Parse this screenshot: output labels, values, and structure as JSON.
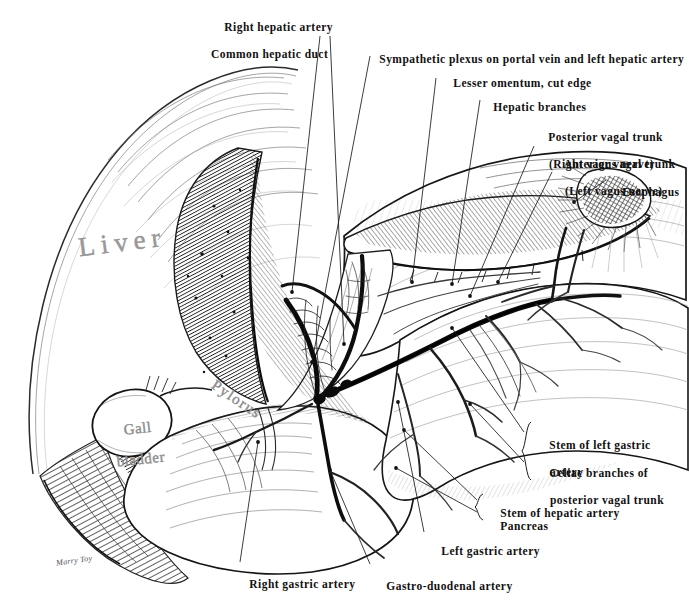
{
  "plate": {
    "title": "Stomach, liver and celiac vagal branches — pen and ink anatomical plate",
    "width": 689,
    "height": 604,
    "background": "#ffffff",
    "ink_color": "#1a1a1a",
    "label_color": "#111111",
    "organ_label_color": "#8d8d8d",
    "signature": "Marry Toy"
  },
  "callouts": [
    {
      "name": "right-hepatic-artery",
      "lines": [
        "Right hepatic artery",
        "Common hepatic duct"
      ],
      "align": "left",
      "x": 211,
      "y": 7
    },
    {
      "name": "sympathetic-plexus",
      "lines": [
        "Sympathetic plexus on portal vein and left hepatic artery"
      ],
      "align": "left",
      "x": 366,
      "y": 39
    },
    {
      "name": "lesser-omentum",
      "lines": [
        "Lesser omentum, cut edge"
      ],
      "align": "left",
      "x": 440,
      "y": 63
    },
    {
      "name": "hepatic-branches",
      "lines": [
        "Hepatic branches"
      ],
      "align": "left",
      "x": 480,
      "y": 87
    },
    {
      "name": "posterior-vagal-trunk",
      "lines": [
        "Posterior vagal trunk",
        "(Right vagus nerve)"
      ],
      "align": "left",
      "x": 535,
      "y": 117,
      "indent": [
        0,
        1
      ]
    },
    {
      "name": "anterior-vagal-trunk",
      "lines": [
        "Anterior vagal trunk",
        "(Left vagus nerve)"
      ],
      "align": "left",
      "x": 551,
      "y": 144,
      "indent": [
        0,
        1
      ]
    },
    {
      "name": "esophagus",
      "lines": [
        "Esophagus"
      ],
      "align": "left",
      "x": 609,
      "y": 172
    },
    {
      "name": "stem-of-left-gastric-artery",
      "lines": [
        "Stem of left gastric",
        "artery"
      ],
      "align": "left",
      "x": 536,
      "y": 425,
      "indent": [
        0,
        1
      ]
    },
    {
      "name": "celiac-branches-of-posterior-vagal-trunk",
      "lines": [
        "Celiac branches of",
        "posterior vagal trunk"
      ],
      "align": "left",
      "x": 536,
      "y": 453,
      "indent": [
        0,
        1
      ]
    },
    {
      "name": "stem-of-hepatic-artery",
      "lines": [
        "Stem of hepatic artery"
      ],
      "align": "left",
      "x": 487,
      "y": 499
    },
    {
      "name": "pancreas",
      "lines": [
        "Pancreas"
      ],
      "align": "left",
      "x": 487,
      "y": 512
    },
    {
      "name": "left-gastric-artery",
      "lines": [
        "Left gastric artery"
      ],
      "align": "left",
      "x": 428,
      "y": 537
    },
    {
      "name": "gastro-duodenal-artery",
      "lines": [
        "Gastro-duodenal artery"
      ],
      "align": "left",
      "x": 373,
      "y": 569
    },
    {
      "name": "right-gastric-artery",
      "lines": [
        "Right gastric artery"
      ],
      "align": "left",
      "x": 236,
      "y": 568
    }
  ],
  "organ_labels": [
    {
      "name": "liver",
      "text": "Liver",
      "x": 78,
      "y": 236
    },
    {
      "name": "gall-bladder",
      "line1": "Gall",
      "line2": "bladder",
      "x": 100,
      "y": 413
    },
    {
      "name": "pylorus",
      "text": "Pylorus",
      "x": 210,
      "y": 396
    }
  ],
  "braces": [
    {
      "name": "brace-left-gastric-celiac",
      "x": 527,
      "y": 422,
      "height": 58
    },
    {
      "name": "brace-hepatic-pancreas",
      "x": 479,
      "y": 494,
      "height": 26
    }
  ]
}
